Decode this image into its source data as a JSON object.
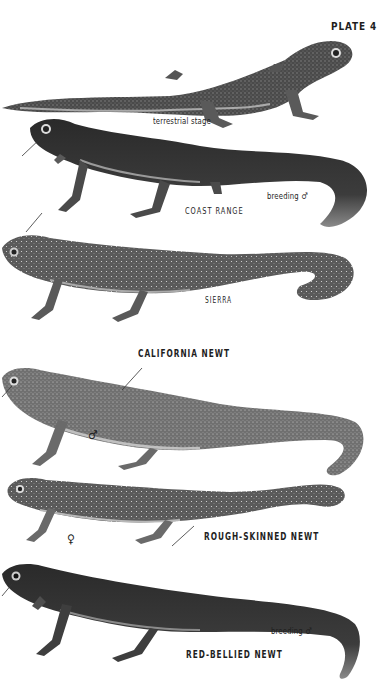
{
  "plate": {
    "title": "PLATE 4",
    "illustrations": [
      {
        "id": "terrestrial",
        "caption": "terrestrial stage"
      },
      {
        "id": "coast-range",
        "caption": "COAST RANGE",
        "note": "breeding ♂"
      },
      {
        "id": "sierra",
        "caption": "SIERRA"
      },
      {
        "id": "california",
        "species": "CALIFORNIA NEWT",
        "sex": "♂"
      },
      {
        "id": "rough-skinned",
        "species": "ROUGH-SKINNED NEWT",
        "sex": "♀"
      },
      {
        "id": "red-bellied",
        "species": "RED-BELLIED NEWT",
        "note": "breeding ♂"
      }
    ]
  },
  "colors": {
    "background": "#ffffff",
    "ink": "#1e1e1e",
    "body_dark": "#3a3a3a",
    "body_mid": "#6e6e6e",
    "belly_light": "#c8c8c8"
  }
}
